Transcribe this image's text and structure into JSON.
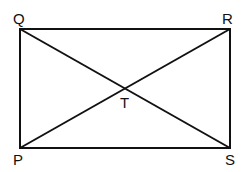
{
  "diagram": {
    "shape": "rectangle with diagonals",
    "vertices": {
      "Q": {
        "label": "Q",
        "x": 20,
        "y": 29
      },
      "R": {
        "label": "R",
        "x": 230,
        "y": 29
      },
      "P": {
        "label": "P",
        "x": 20,
        "y": 148
      },
      "S": {
        "label": "S",
        "x": 230,
        "y": 148
      }
    },
    "intersection": {
      "label": "T",
      "x": 125,
      "y": 88
    },
    "stroke_color": "#111111"
  }
}
